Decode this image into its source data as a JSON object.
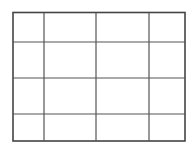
{
  "diagram": {
    "type": "grid",
    "rows": 4,
    "columns": 4,
    "line_color": "#555555",
    "border_color": "#444444",
    "background": "#ffffff"
  }
}
